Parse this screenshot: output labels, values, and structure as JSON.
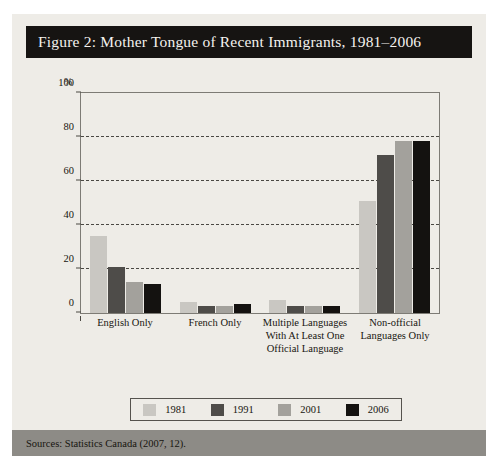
{
  "figure": {
    "title": "Figure 2: Mother Tongue of Recent Immigrants, 1981–2006",
    "source": "Sources: Statistics Canada (2007, 12)."
  },
  "axis": {
    "y_unit": "%",
    "y_ticks": [
      "0",
      "20",
      "40",
      "60",
      "80",
      "100"
    ]
  },
  "legend": {
    "items": [
      {
        "label": "1981",
        "color": "#c9c7c2"
      },
      {
        "label": "1991",
        "color": "#4e4c49"
      },
      {
        "label": "2001",
        "color": "#a3a19c"
      },
      {
        "label": "2006",
        "color": "#141210"
      }
    ]
  },
  "colors": {
    "card_background": "#eeece7",
    "title_background": "#161412",
    "title_text": "#f4f2ee",
    "source_background": "#8d8b86",
    "axis": "#4a4843",
    "frame": "#7d7b75"
  },
  "chart_data": {
    "type": "bar",
    "title": "Figure 2: Mother Tongue of Recent Immigrants, 1981–2006",
    "xlabel": "",
    "ylabel": "%",
    "ylim": [
      0,
      100
    ],
    "yticks": [
      0,
      20,
      40,
      60,
      80,
      100
    ],
    "grid": true,
    "legend_position": "bottom",
    "categories": [
      "English Only",
      "French Only",
      "Multiple Languages With At Least One Official Language",
      "Non-official Languages Only"
    ],
    "category_lines": [
      [
        "English Only"
      ],
      [
        "French Only"
      ],
      [
        "Multiple Languages",
        "With At Least One",
        "Official Language"
      ],
      [
        "Non-official",
        "Languages Only"
      ]
    ],
    "series": [
      {
        "name": "1981",
        "color": "#c9c7c2",
        "values": [
          35,
          5,
          6,
          51
        ]
      },
      {
        "name": "1991",
        "color": "#4e4c49",
        "values": [
          21,
          3,
          3,
          72
        ]
      },
      {
        "name": "2001",
        "color": "#a3a19c",
        "values": [
          14,
          3,
          3,
          78
        ]
      },
      {
        "name": "2006",
        "color": "#141210",
        "values": [
          13,
          4,
          3,
          78
        ]
      }
    ]
  }
}
